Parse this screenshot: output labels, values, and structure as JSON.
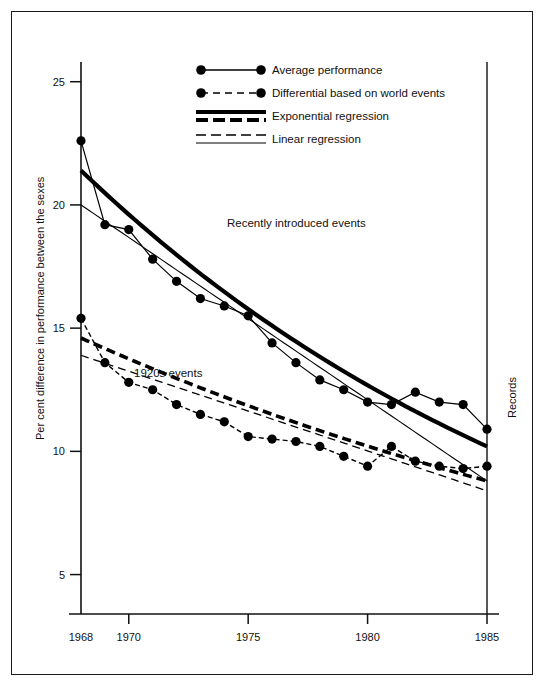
{
  "figure": {
    "background_color": "#ffffff",
    "frame_color": "#1a1a1a",
    "ink_color": "#000000"
  },
  "labels": {
    "y_axis_title": "Per cent difference in performance between the sexes",
    "right_axis_title": "Records",
    "annotation_upper": "Recently introduced events",
    "annotation_lower": "1920s events"
  },
  "legend": {
    "items": [
      {
        "label": "Average performance",
        "style": "solid-line-with-markers"
      },
      {
        "label": "Differential based on world events",
        "style": "dashed-line-with-markers"
      },
      {
        "label": "Exponential regression",
        "style": "thick-solid-over-thick-dashed"
      },
      {
        "label": "Linear regression",
        "style": "thin-dashed-over-thin-solid"
      }
    ]
  },
  "chart_data": {
    "type": "line",
    "title": "",
    "subtitle": "",
    "xlabel": "",
    "ylabel": "Per cent difference in performance between the sexes",
    "xlim": [
      1968,
      1985
    ],
    "ylim": [
      3.4,
      25.8
    ],
    "grid": false,
    "legend_position": "top-center",
    "x_ticks": [
      1968,
      1970,
      1975,
      1980,
      1985
    ],
    "x_tick_labels": [
      "1968",
      "1970",
      "1975",
      "1980",
      "1985"
    ],
    "y_ticks": [
      5,
      10,
      15,
      20,
      25
    ],
    "y_tick_labels": [
      "5",
      "10",
      "15",
      "20",
      "25"
    ],
    "annotations": [
      {
        "text": "Recently introduced events",
        "x": 1974.6,
        "y": 17.8
      },
      {
        "text": "1920s events",
        "x": 1970.6,
        "y": 10.7
      },
      {
        "text": "Records",
        "x": 1987.0,
        "y": 13.5,
        "rotation": -90
      }
    ],
    "series": [
      {
        "name": "Average performance",
        "group": "Recently introduced events",
        "marker": "filled-circle",
        "line": "solid",
        "x": [
          1968,
          1969,
          1970,
          1971,
          1972,
          1973,
          1974,
          1975,
          1976,
          1977,
          1978,
          1979,
          1980,
          1981,
          1982,
          1983,
          1984,
          1985
        ],
        "values": [
          22.6,
          19.2,
          19.0,
          17.8,
          16.9,
          16.2,
          15.9,
          15.5,
          14.4,
          13.6,
          12.9,
          12.5,
          12.0,
          11.9,
          12.4,
          12.0,
          11.9,
          10.9
        ]
      },
      {
        "name": "Differential based on world events",
        "group": "1920s events",
        "marker": "filled-circle",
        "line": "dashed",
        "x": [
          1968,
          1969,
          1970,
          1971,
          1972,
          1973,
          1974,
          1975,
          1976,
          1977,
          1978,
          1979,
          1980,
          1981,
          1982,
          1983,
          1984,
          1985
        ],
        "values": [
          15.4,
          13.6,
          12.8,
          12.5,
          11.9,
          11.5,
          11.2,
          10.6,
          10.5,
          10.4,
          10.2,
          9.8,
          9.4,
          10.2,
          9.6,
          9.4,
          9.3,
          9.4
        ]
      }
    ],
    "regressions": [
      {
        "name": "Exponential regression",
        "group": "Recently introduced events",
        "style": "thick-solid",
        "x": [
          1968,
          1985
        ],
        "values": [
          21.4,
          10.2
        ]
      },
      {
        "name": "Linear regression",
        "group": "Recently introduced events",
        "style": "thin-solid",
        "x": [
          1968,
          1985
        ],
        "values": [
          20.0,
          8.8
        ]
      },
      {
        "name": "Exponential regression",
        "group": "1920s events",
        "style": "thick-dashed",
        "x": [
          1968,
          1985
        ],
        "values": [
          14.6,
          8.8
        ]
      },
      {
        "name": "Linear regression",
        "group": "1920s events",
        "style": "thin-dashed",
        "x": [
          1968,
          1985
        ],
        "values": [
          13.9,
          8.4
        ]
      }
    ]
  }
}
